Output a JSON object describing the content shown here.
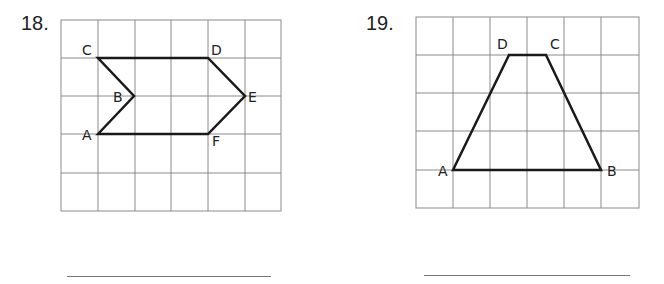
{
  "problems": [
    {
      "number": "18.",
      "grid": {
        "cols": 6,
        "rows": 5
      },
      "shape": "hexagon",
      "vertices": [
        {
          "label": "A",
          "col": 1,
          "row": 3
        },
        {
          "label": "B",
          "col": 2,
          "row": 2
        },
        {
          "label": "C",
          "col": 1,
          "row": 1
        },
        {
          "label": "D",
          "col": 4,
          "row": 1
        },
        {
          "label": "E",
          "col": 5,
          "row": 2
        },
        {
          "label": "F",
          "col": 4,
          "row": 3
        }
      ],
      "answer": ""
    },
    {
      "number": "19.",
      "grid": {
        "cols": 6,
        "rows": 5
      },
      "shape": "trapezoid",
      "vertices": [
        {
          "label": "A",
          "col": 1,
          "row": 4
        },
        {
          "label": "B",
          "col": 5,
          "row": 4
        },
        {
          "label": "C",
          "col": 3.5,
          "row": 1
        },
        {
          "label": "D",
          "col": 2.5,
          "row": 1
        }
      ],
      "answer": ""
    }
  ],
  "colors": {
    "grid": "#8a8a8a",
    "shape": "#1a1a1a",
    "answer_line": "#777777"
  }
}
